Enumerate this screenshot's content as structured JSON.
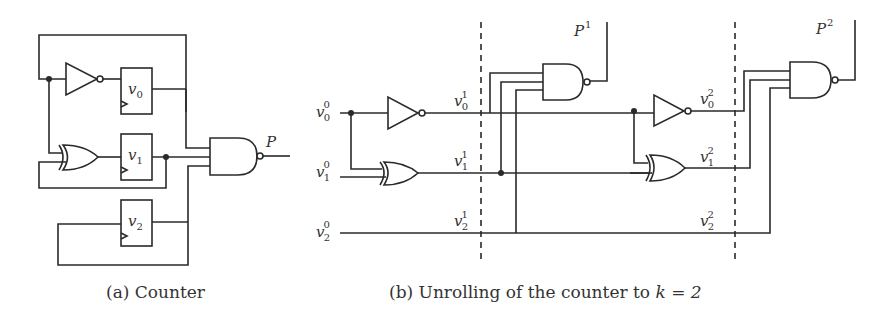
{
  "figure": {
    "panel_a": {
      "caption": "(a) Counter",
      "registers": [
        "v0",
        "v1",
        "v2"
      ],
      "register_labels": {
        "v0": {
          "base": "v",
          "sub": "0"
        },
        "v1": {
          "base": "v",
          "sub": "1"
        },
        "v2": {
          "base": "v",
          "sub": "2"
        }
      },
      "gates": [
        "NOT",
        "XOR",
        "NAND"
      ],
      "output_label": "P"
    },
    "panel_b": {
      "caption_prefix": "(b) Unrolling of the counter to ",
      "caption_math": "k = 2",
      "inputs": [
        {
          "base": "v",
          "sub": "0",
          "sup": "0"
        },
        {
          "base": "v",
          "sub": "1",
          "sup": "0"
        },
        {
          "base": "v",
          "sub": "2",
          "sup": "0"
        }
      ],
      "step1": [
        {
          "base": "v",
          "sub": "0",
          "sup": "1"
        },
        {
          "base": "v",
          "sub": "1",
          "sup": "1"
        },
        {
          "base": "v",
          "sub": "2",
          "sup": "1"
        }
      ],
      "step2": [
        {
          "base": "v",
          "sub": "0",
          "sup": "2"
        },
        {
          "base": "v",
          "sub": "1",
          "sup": "2"
        },
        {
          "base": "v",
          "sub": "2",
          "sup": "2"
        }
      ],
      "outputs": [
        {
          "base": "P",
          "sup": "1"
        },
        {
          "base": "P",
          "sup": "2"
        }
      ],
      "k": "2"
    }
  }
}
